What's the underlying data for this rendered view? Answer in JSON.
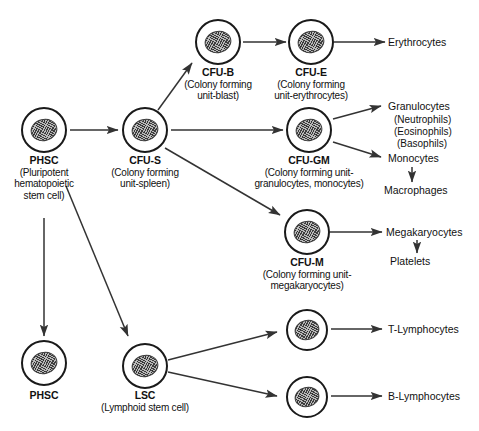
{
  "diagram": {
    "ink_color": "#111111",
    "nucleus_color": "#b9b9b9",
    "nodes": {
      "phsc_top": {
        "name": "PHSC",
        "sub_line1": "(Pluripotent",
        "sub_line2": "hematopoietic",
        "sub_line3": "stem cell)"
      },
      "cfu_s": {
        "name": "CFU-S",
        "sub_line1": "(Colony forming",
        "sub_line2": "unit-spleen)"
      },
      "cfu_b": {
        "name": "CFU-B",
        "sub_line1": "(Colony forming",
        "sub_line2": "unit-blast)"
      },
      "cfu_e": {
        "name": "CFU-E",
        "sub_line1": "(Colony forming",
        "sub_line2": "unit-erythrocytes)"
      },
      "cfu_gm": {
        "name": "CFU-GM",
        "sub_line1": "(Colony forming unit-",
        "sub_line2": "granulocytes, monocytes)"
      },
      "cfu_m": {
        "name": "CFU-M",
        "sub_line1": "(Colony forming unit-",
        "sub_line2": "megakaryocytes)"
      },
      "phsc_bottom": {
        "name": "PHSC"
      },
      "lsc": {
        "name": "LSC",
        "sub_line1": "(Lymphoid stem cell)"
      },
      "t_cell": {
        "name": ""
      },
      "b_cell": {
        "name": ""
      }
    },
    "terminals": {
      "erythrocytes": "Erythrocytes",
      "granulocytes": "Granulocytes",
      "neutrophils": "(Neutrophils)",
      "eosinophils": "(Eosinophils)",
      "basophils": "(Basophils)",
      "monocytes": "Monocytes",
      "macrophages": "Macrophages",
      "megakaryocytes": "Megakaryocytes",
      "platelets": "Platelets",
      "t_lymphocytes": "T-Lymphocytes",
      "b_lymphocytes": "B-Lymphocytes"
    }
  }
}
